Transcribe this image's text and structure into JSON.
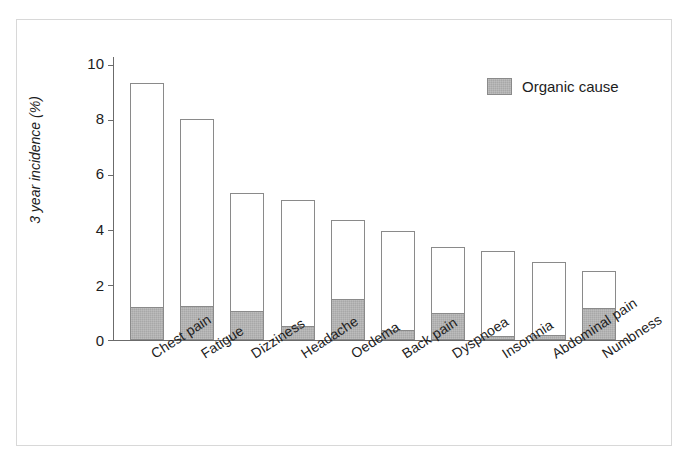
{
  "chart_data": {
    "type": "bar",
    "title": "",
    "subtitle": "",
    "xlabel": "",
    "ylabel": "3 year incidence (%)",
    "ylim": [
      0,
      10
    ],
    "yticks": [
      0,
      2,
      4,
      6,
      8,
      10
    ],
    "ytick_labels": [
      "0",
      "2",
      "4",
      "6",
      "8",
      "10"
    ],
    "grid": false,
    "stacked": true,
    "legend_position": "upper-right",
    "legend": [
      "Organic cause"
    ],
    "categories": [
      "Chest pain",
      "Fatigue",
      "Dizziness",
      "Headache",
      "Oedema",
      "Back pain",
      "Dyspnoea",
      "Insomnia",
      "Abdominal pain",
      "Numbness"
    ],
    "series": [
      {
        "name": "Organic cause",
        "color": "#a8a8a8",
        "values": [
          1.2,
          1.25,
          1.05,
          0.5,
          1.5,
          0.35,
          1.0,
          0.15,
          0.2,
          1.15
        ]
      },
      {
        "name": "Total incidence",
        "color": "#ffffff",
        "values": [
          9.35,
          8.05,
          5.35,
          5.1,
          4.35,
          3.95,
          3.4,
          3.25,
          2.85,
          2.5
        ]
      }
    ]
  },
  "legend": {
    "organic_label": "Organic cause",
    "swatch_color": "#a8a8a8"
  },
  "axes": {
    "y_title": "3 year incidence (%)",
    "y_tick_labels": [
      "10",
      "8",
      "6",
      "4",
      "2",
      "0"
    ]
  },
  "colors": {
    "bar_outline": "#8a8a8a",
    "organic_fill": "#a8a8a8",
    "total_fill": "#ffffff",
    "axis": "#6b6b6b",
    "frame": "#d8d8d8",
    "text": "#1d1d1d"
  }
}
